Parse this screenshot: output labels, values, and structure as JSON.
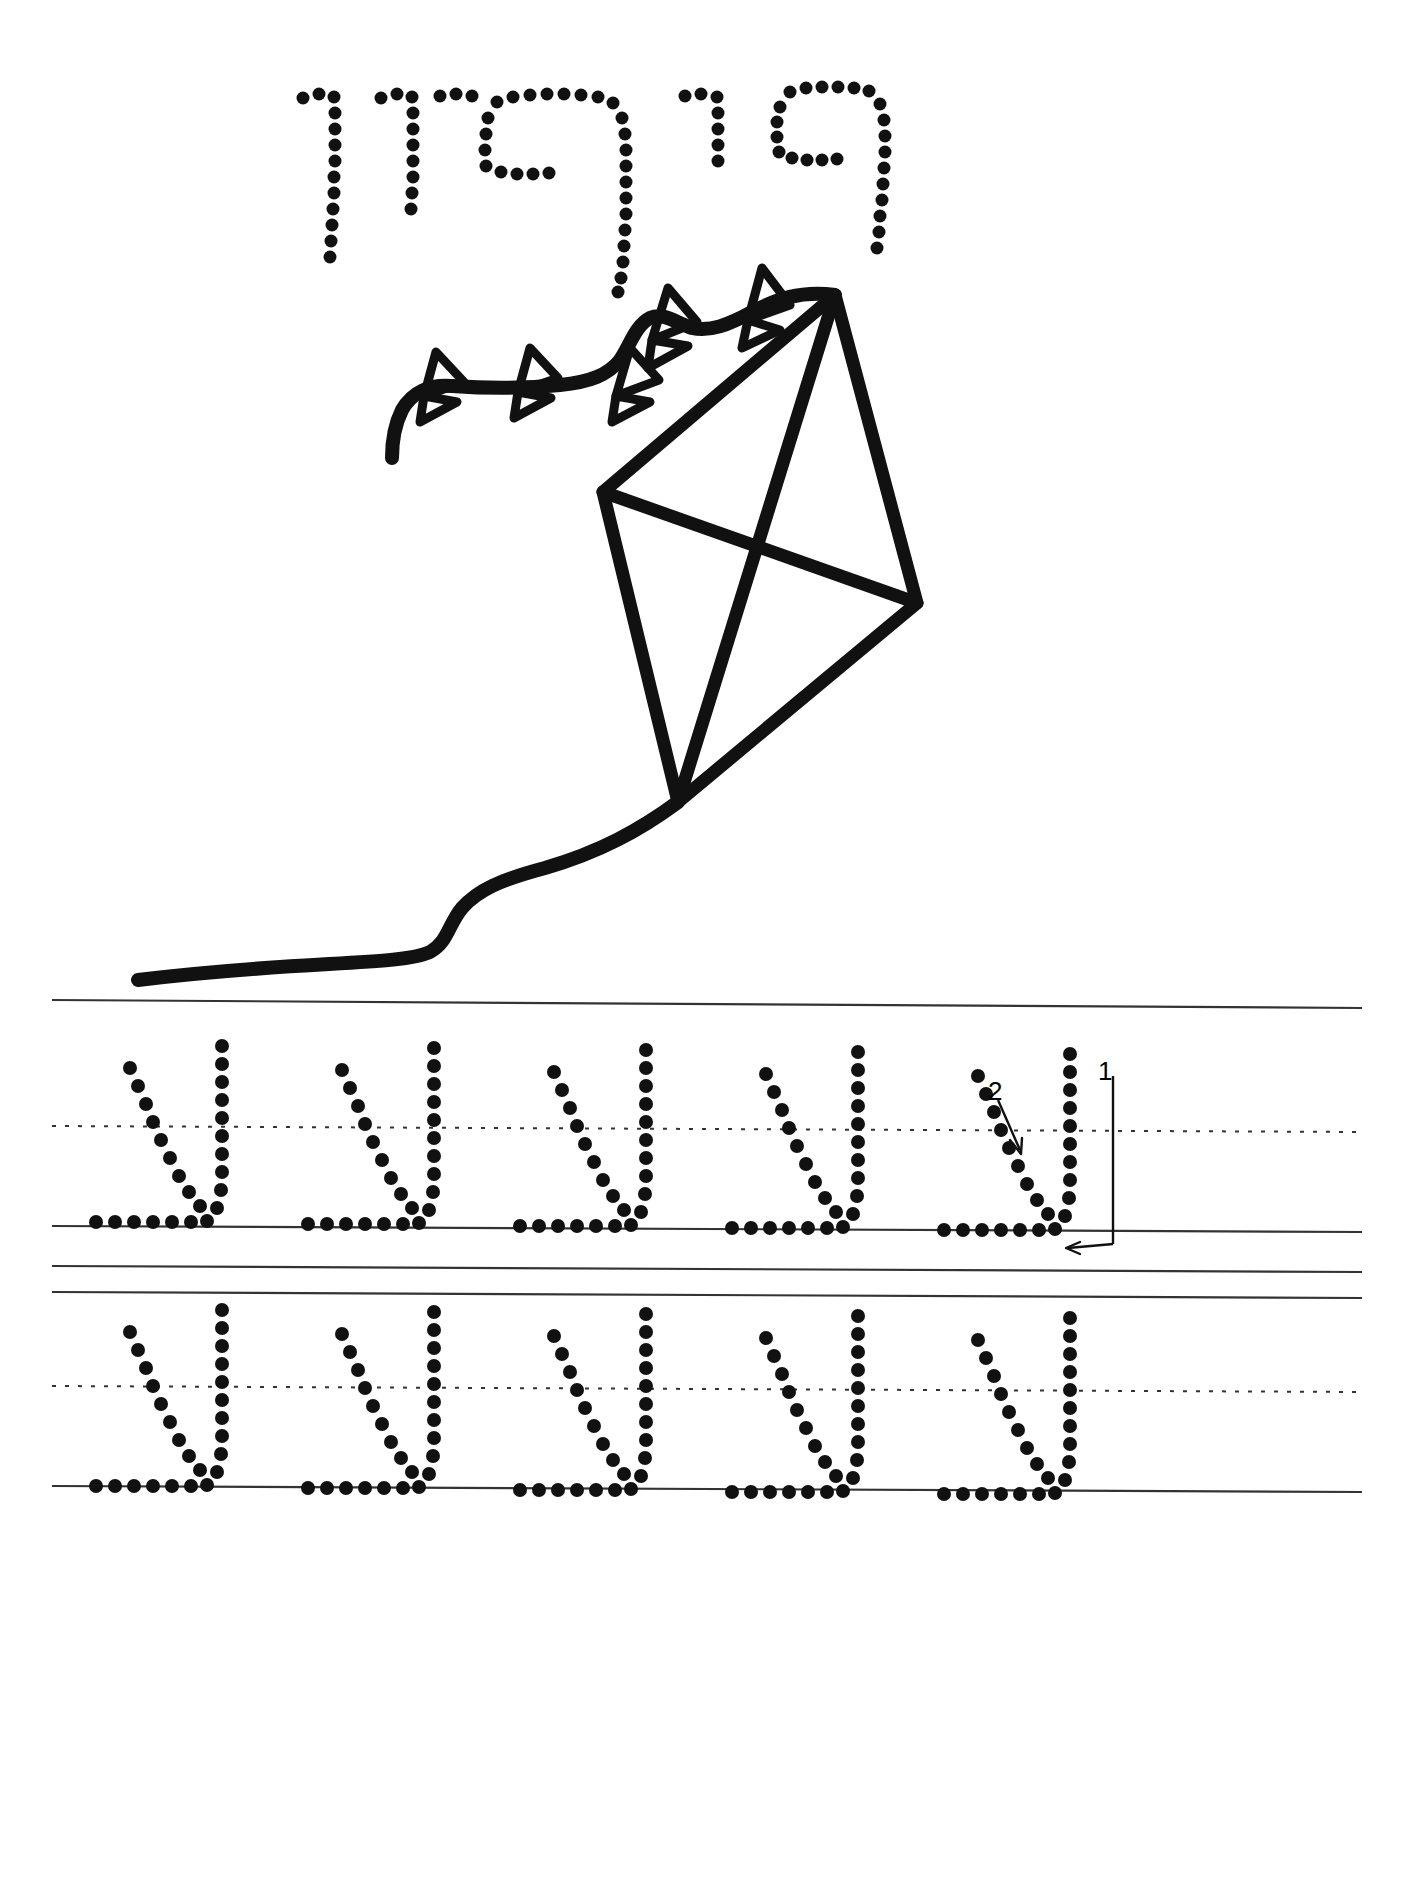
{
  "document": {
    "type": "handwriting-tracing-worksheet",
    "language": "Hebrew",
    "direction": "rtl",
    "title_word": "עפיפון",
    "title_word_transliteration": "afifon",
    "title_word_meaning": "kite",
    "letter_practiced": "ע",
    "letter_name": "ayin",
    "background_color": "#ffffff",
    "ink_color": "#000000",
    "rule_line_color": "#333333"
  },
  "title": {
    "name": "dotted-title",
    "letters": [
      {
        "char": "ע",
        "order": 1,
        "x": 812,
        "y": 90
      },
      {
        "char": "פ",
        "order": 2,
        "x": 690,
        "y": 90
      },
      {
        "char": "י",
        "order": 3,
        "x": 618,
        "y": 90
      },
      {
        "char": "פ",
        "order": 4,
        "x": 512,
        "y": 90
      },
      {
        "char": "ו",
        "order": 5,
        "x": 408,
        "y": 90
      },
      {
        "char": "ן",
        "order": 6,
        "x": 330,
        "y": 90
      }
    ],
    "dot_radius": 6
  },
  "illustration": {
    "name": "kite-illustration",
    "caption": "kite",
    "stroke_width": 13,
    "kite_body": {
      "top": [
        835,
        295
      ],
      "left": [
        603,
        492
      ],
      "right": [
        917,
        603
      ],
      "bottom": [
        678,
        802
      ],
      "spars": [
        "top-bottom",
        "left-right"
      ]
    },
    "tail": {
      "bow_count": 6,
      "end": [
        392,
        458
      ]
    },
    "string": {
      "start": [
        678,
        802
      ],
      "end": [
        138,
        980
      ]
    }
  },
  "practice": {
    "name": "practice-area",
    "rows": [
      {
        "index": 1,
        "top_line_y": 1000,
        "mid_dash_y": 1128,
        "base_line_y": 1228,
        "bottom_line_y": 1268,
        "letter_count": 5,
        "letters": [
          "ע",
          "ע",
          "ע",
          "ע",
          "ע"
        ],
        "has_stroke_guide": true
      },
      {
        "index": 2,
        "top_line_y": 1292,
        "mid_dash_y": 1388,
        "base_line_y": 1488,
        "letter_count": 5,
        "letters": [
          "ע",
          "ע",
          "ע",
          "ע",
          "ע"
        ],
        "has_stroke_guide": false
      }
    ],
    "stroke_guide": {
      "numbers": [
        "1",
        "2"
      ],
      "stroke_1_label": "1",
      "stroke_2_label": "2",
      "direction_arrow": "←",
      "description": "stroke order for letter ayin"
    }
  }
}
